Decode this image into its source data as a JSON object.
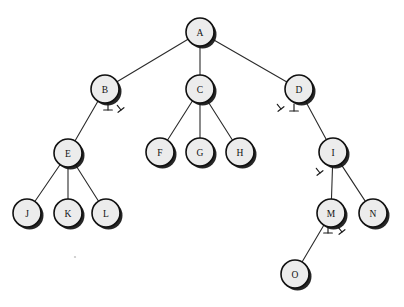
{
  "diagram": {
    "type": "rooted-tree",
    "background_color": "#ffffff",
    "node_fill_color": "#ececec",
    "node_stroke_color": "#101010",
    "edge_color": "#2b2b2b",
    "label_color": "#111111",
    "node_radius": 14,
    "shadow_offset": {
      "x": 2.5,
      "y": 2.5
    }
  },
  "nodes": [
    {
      "id": "A",
      "label": "A",
      "x": 200,
      "y": 32,
      "level": 0,
      "parent": null
    },
    {
      "id": "B",
      "label": "B",
      "x": 105,
      "y": 89,
      "level": 1,
      "parent": "A"
    },
    {
      "id": "C",
      "label": "C",
      "x": 200,
      "y": 89,
      "level": 1,
      "parent": "A"
    },
    {
      "id": "D",
      "label": "D",
      "x": 299,
      "y": 89,
      "level": 1,
      "parent": "A"
    },
    {
      "id": "E",
      "label": "E",
      "x": 68,
      "y": 153,
      "level": 2,
      "parent": "B"
    },
    {
      "id": "F",
      "label": "F",
      "x": 160,
      "y": 152,
      "level": 2,
      "parent": "C"
    },
    {
      "id": "G",
      "label": "G",
      "x": 200,
      "y": 152,
      "level": 2,
      "parent": "C"
    },
    {
      "id": "H",
      "label": "H",
      "x": 240,
      "y": 152,
      "level": 2,
      "parent": "C"
    },
    {
      "id": "I",
      "label": "I",
      "x": 333,
      "y": 152,
      "level": 2,
      "parent": "D"
    },
    {
      "id": "J",
      "label": "J",
      "x": 27,
      "y": 213,
      "level": 3,
      "parent": "E"
    },
    {
      "id": "K",
      "label": "K",
      "x": 68,
      "y": 213,
      "level": 3,
      "parent": "E"
    },
    {
      "id": "L",
      "label": "L",
      "x": 106,
      "y": 213,
      "level": 3,
      "parent": "E"
    },
    {
      "id": "M",
      "label": "M",
      "x": 331,
      "y": 213,
      "level": 3,
      "parent": "I"
    },
    {
      "id": "N",
      "label": "N",
      "x": 373,
      "y": 213,
      "level": 3,
      "parent": "I"
    },
    {
      "id": "O",
      "label": "O",
      "x": 295,
      "y": 274,
      "level": 4,
      "parent": "M"
    }
  ],
  "edges": [
    {
      "from": "A",
      "to": "B"
    },
    {
      "from": "A",
      "to": "C"
    },
    {
      "from": "A",
      "to": "D"
    },
    {
      "from": "B",
      "to": "E"
    },
    {
      "from": "C",
      "to": "F"
    },
    {
      "from": "C",
      "to": "G"
    },
    {
      "from": "C",
      "to": "H"
    },
    {
      "from": "D",
      "to": "I"
    },
    {
      "from": "E",
      "to": "J"
    },
    {
      "from": "E",
      "to": "K"
    },
    {
      "from": "E",
      "to": "L"
    },
    {
      "from": "I",
      "to": "M"
    },
    {
      "from": "I",
      "to": "N"
    },
    {
      "from": "M",
      "to": "O"
    }
  ],
  "null_markers": [
    {
      "glyph": "up-tack",
      "node": "B",
      "x": 108,
      "y": 110,
      "rotation": 0,
      "size": 7
    },
    {
      "glyph": "up-tack",
      "node": "B",
      "x": 121,
      "y": 110,
      "rotation": -38,
      "size": 6
    },
    {
      "glyph": "up-tack",
      "node": "D",
      "x": 294,
      "y": 111,
      "rotation": 0,
      "size": 7
    },
    {
      "glyph": "up-tack",
      "node": "D",
      "x": 281,
      "y": 109,
      "rotation": -38,
      "size": 6
    },
    {
      "glyph": "up-tack",
      "node": "I",
      "x": 320,
      "y": 173,
      "rotation": -38,
      "size": 6
    },
    {
      "glyph": "up-tack",
      "node": "M",
      "x": 328,
      "y": 233,
      "rotation": 0,
      "size": 7
    },
    {
      "glyph": "up-tack",
      "node": "M",
      "x": 342,
      "y": 232,
      "rotation": -38,
      "size": 6
    }
  ],
  "artifacts": [
    {
      "name": "scan-speck",
      "x": 75,
      "y": 257,
      "r": 1.1
    }
  ]
}
